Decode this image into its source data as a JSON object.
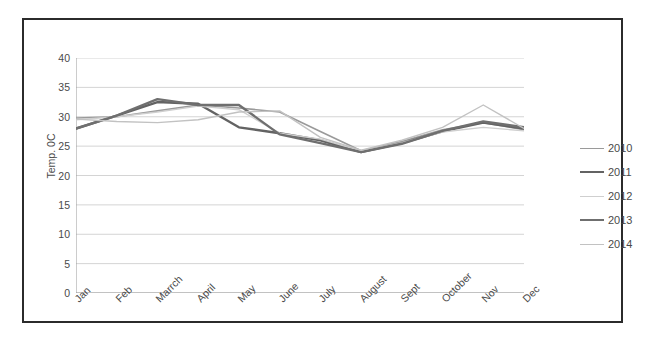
{
  "chart_data": {
    "type": "line",
    "title": "",
    "xlabel": "",
    "ylabel": "Temp. 0C",
    "ylim": [
      0,
      40
    ],
    "ytick_step": 5,
    "yticks": [
      40,
      35,
      30,
      25,
      20,
      15,
      10,
      5,
      0
    ],
    "grid": true,
    "legend_position": "right",
    "categories": [
      "Jan",
      "Feb",
      "Marrch",
      "April",
      "May",
      "June",
      "July",
      "August",
      "Sept",
      "October",
      "Nov",
      "Dec"
    ],
    "series": [
      {
        "name": "2010",
        "color": "#9a9a9a",
        "width": 1.6,
        "values": [
          29.8,
          30.0,
          31.0,
          32.0,
          31.5,
          30.8,
          27.5,
          24.2,
          25.8,
          27.8,
          29.0,
          27.8
        ]
      },
      {
        "name": "2011",
        "color": "#636363",
        "width": 2.4,
        "values": [
          28.0,
          30.2,
          32.5,
          32.2,
          28.2,
          27.2,
          26.0,
          24.0,
          25.5,
          27.5,
          29.0,
          28.0
        ]
      },
      {
        "name": "2012",
        "color": "#cfcfcf",
        "width": 1.4,
        "values": [
          29.5,
          30.0,
          30.8,
          31.8,
          31.2,
          27.2,
          26.2,
          24.2,
          25.6,
          27.4,
          28.2,
          27.6
        ]
      },
      {
        "name": "2013",
        "color": "#6f6f6f",
        "width": 2.4,
        "values": [
          28.0,
          30.2,
          33.0,
          32.0,
          32.0,
          27.0,
          25.5,
          24.0,
          25.4,
          27.6,
          29.2,
          28.2
        ]
      },
      {
        "name": "2014",
        "color": "#c2c2c2",
        "width": 1.4,
        "values": [
          29.6,
          29.2,
          29.0,
          29.5,
          30.8,
          31.0,
          26.5,
          24.3,
          26.0,
          28.2,
          32.0,
          28.0
        ]
      }
    ]
  },
  "legend": {
    "items": [
      {
        "label": "2010"
      },
      {
        "label": "2011"
      },
      {
        "label": "2012"
      },
      {
        "label": "2013"
      },
      {
        "label": "2014"
      }
    ]
  },
  "axes": {
    "y_title": "Temp. 0C"
  }
}
